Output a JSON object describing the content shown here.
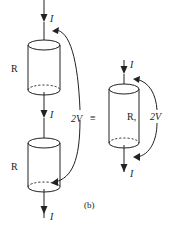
{
  "diagram": {
    "caption": "(b)",
    "equivalence_symbol": "≡",
    "left_circuit": {
      "resistor_top": {
        "label": "R"
      },
      "resistor_bottom": {
        "label": "R"
      },
      "current_labels": [
        "I",
        "I",
        "I"
      ],
      "voltage_label": "2V"
    },
    "right_circuit": {
      "resistor": {
        "label": "R,"
      },
      "current_labels": [
        "I",
        "I"
      ],
      "voltage_label": "2V"
    }
  }
}
